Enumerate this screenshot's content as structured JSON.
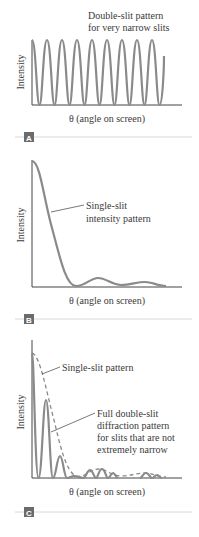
{
  "panels": [
    {
      "id": "A",
      "tag": "A",
      "ylabel": "Intensity",
      "xlabel": "θ (angle on screen)",
      "annotations": [
        "Double-slit pattern",
        "for very narrow slits"
      ]
    },
    {
      "id": "B",
      "tag": "B",
      "ylabel": "Intensity",
      "xlabel": "θ (angle on screen)",
      "annotations": [
        "Single-slit",
        "intensity pattern"
      ]
    },
    {
      "id": "C",
      "tag": "C",
      "ylabel": "Intensity",
      "xlabel": "θ (angle on screen)",
      "annotation_single": "Single-slit pattern",
      "annotations": [
        "Full double-slit",
        "diffraction pattern",
        "for slits that are not",
        "extremely narrow"
      ]
    }
  ],
  "colors": {
    "curve": "#8a8a8a",
    "axis": "#444444",
    "tag_bg": "#6b6b6b",
    "divider": "#d8d8d8"
  }
}
